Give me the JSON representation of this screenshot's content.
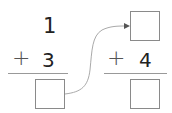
{
  "problem_left": {
    "top_number": "1",
    "operator": "+",
    "addend": "3",
    "answer_box": ""
  },
  "problem_right": {
    "top_box": "",
    "operator": "+",
    "addend": "4",
    "answer_box": ""
  },
  "connector": {
    "icon": "arrow-curve-icon",
    "color": "#aaaaaa"
  }
}
